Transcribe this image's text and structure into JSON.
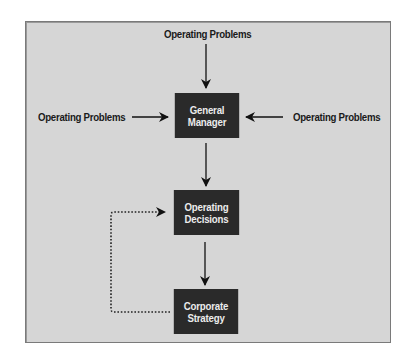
{
  "diagram": {
    "background": "#d6d6d6",
    "box_color": "#2a2a2a",
    "box_text_color": "#ececec",
    "inputs": {
      "top": "Operating Problems",
      "left": "Operating Problems",
      "right": "Operating Problems"
    },
    "nodes": {
      "general_manager": [
        "General",
        "Manager"
      ],
      "operating_decisions": [
        "Operating",
        "Decisions"
      ],
      "corporate_strategy": [
        "Corporate",
        "Strategy"
      ]
    },
    "edges": [
      {
        "from": "top_input",
        "to": "general_manager",
        "style": "solid"
      },
      {
        "from": "left_input",
        "to": "general_manager",
        "style": "solid"
      },
      {
        "from": "right_input",
        "to": "general_manager",
        "style": "solid"
      },
      {
        "from": "general_manager",
        "to": "operating_decisions",
        "style": "solid"
      },
      {
        "from": "operating_decisions",
        "to": "corporate_strategy",
        "style": "solid"
      },
      {
        "from": "corporate_strategy",
        "to": "operating_decisions",
        "style": "dotted"
      }
    ]
  }
}
